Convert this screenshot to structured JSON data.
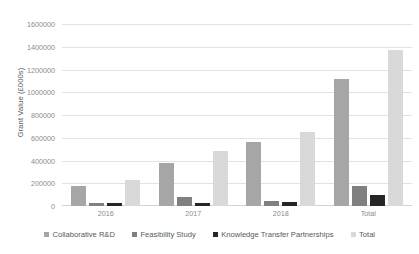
{
  "chart_data": {
    "type": "bar",
    "title": "",
    "xlabel": "",
    "ylabel": "Grant Value (£000s)",
    "categories": [
      "2016",
      "2017",
      "2018",
      "Total"
    ],
    "series": [
      {
        "name": "Collaborative R&D",
        "color": "#a6a6a6",
        "values": [
          175000,
          380000,
          565000,
          1120000
        ]
      },
      {
        "name": "Feasibility Study",
        "color": "#808080",
        "values": [
          30000,
          75000,
          45000,
          175000
        ]
      },
      {
        "name": "Knowledge Transfer Partnerships",
        "color": "#262626",
        "values": [
          25000,
          30000,
          35000,
          95000
        ]
      },
      {
        "name": "Total",
        "color": "#d9d9d9",
        "values": [
          230000,
          485000,
          650000,
          1375000
        ]
      }
    ],
    "ylim": [
      0,
      1600000
    ],
    "yticks": [
      0,
      200000,
      400000,
      600000,
      800000,
      1000000,
      1200000,
      1400000,
      1600000
    ],
    "ytick_labels": [
      "0",
      "200000",
      "400000",
      "600000",
      "800000",
      "1000000",
      "1200000",
      "1400000",
      "1600000"
    ],
    "grid": true,
    "legend_position": "bottom"
  },
  "colors": {
    "gridline": "#e2e2e2",
    "text": "#8c8c8c",
    "legend_text": "#595959",
    "background": "#ffffff"
  }
}
